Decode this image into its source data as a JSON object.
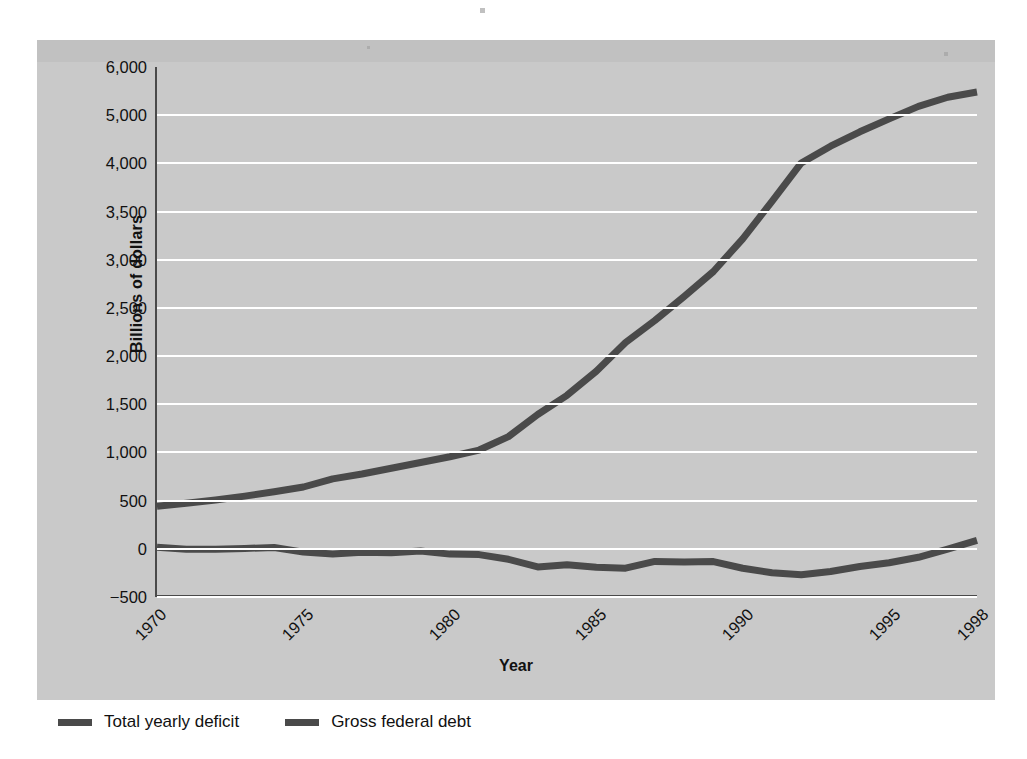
{
  "chart_data": {
    "type": "line",
    "title": "",
    "subtitle": "",
    "xlabel": "Year",
    "ylabel": "Billions of dollars",
    "grid": true,
    "legend_position": "below-left",
    "xlim": [
      1970,
      1998
    ],
    "ylim": [
      -500,
      6000
    ],
    "xticks": [
      "1970",
      "1975",
      "1980",
      "1985",
      "1990",
      "1995",
      "1998"
    ],
    "xtick_values": [
      1970,
      1975,
      1980,
      1985,
      1990,
      1995,
      1998
    ],
    "yticks": [
      "6,000",
      "5,000",
      "4,000",
      "3,500",
      "3,000",
      "2,500",
      "2,000",
      "1,500",
      "1,000",
      "500",
      "0",
      "−500"
    ],
    "ytick_values": [
      6000,
      5000,
      4000,
      3500,
      3000,
      2500,
      2000,
      1500,
      1000,
      500,
      0,
      -500
    ],
    "x": [
      1970,
      1971,
      1972,
      1973,
      1974,
      1975,
      1976,
      1977,
      1978,
      1979,
      1980,
      1981,
      1982,
      1983,
      1984,
      1985,
      1986,
      1987,
      1988,
      1989,
      1990,
      1991,
      1992,
      1993,
      1994,
      1995,
      1996,
      1997,
      1998
    ],
    "series": [
      {
        "name": "Total yearly deficit",
        "color": "#4a4a4a",
        "values": [
          -3,
          -23,
          -23,
          -15,
          -6,
          -53,
          -74,
          -54,
          -59,
          -41,
          -74,
          -79,
          -128,
          -208,
          -185,
          -212,
          -221,
          -150,
          -155,
          -152,
          -221,
          -269,
          -290,
          -255,
          -203,
          -164,
          -107,
          -22,
          69
        ]
      },
      {
        "name": "Gross federal debt",
        "color": "#4a4a4a",
        "values": [
          425,
          455,
          490,
          530,
          575,
          625,
          710,
          760,
          820,
          880,
          940,
          1010,
          1150,
          1380,
          1580,
          1830,
          2130,
          2360,
          2610,
          2870,
          3210,
          3600,
          4000,
          4350,
          4650,
          4920,
          5180,
          5370,
          5480
        ]
      }
    ]
  },
  "axes": {
    "ylabel": "Billions of dollars",
    "xlabel": "Year"
  },
  "legend": {
    "items": [
      {
        "label": "Total yearly deficit",
        "color": "#4a4a4a"
      },
      {
        "label": "Gross federal debt",
        "color": "#4a4a4a"
      }
    ]
  },
  "colors": {
    "panel_background": "#c9c9c9",
    "gridline": "#ffffff",
    "axis": "#4a4a4a",
    "line": "#4a4a4a",
    "page_background": "#ffffff",
    "text": "#111111"
  }
}
